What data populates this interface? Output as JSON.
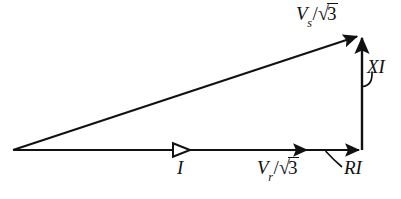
{
  "figure": {
    "background_color": "#ffffff",
    "stroke_color": "#111111",
    "width": 401,
    "height": 199
  },
  "labels": {
    "sending_voltage": {
      "name": "Vs/sqrt3",
      "variable": "V",
      "subscript": "s",
      "slash": "/",
      "radical": "√",
      "radicand": "3"
    },
    "receiving_voltage": {
      "name": "Vr/sqrt3",
      "variable": "V",
      "subscript": "r",
      "slash": "/",
      "radical": "√",
      "radicand": "3"
    },
    "reactive_drop": {
      "name": "XI",
      "text": "XI"
    },
    "resistive_drop": {
      "name": "RI",
      "text": "RI"
    },
    "current": {
      "name": "I",
      "text": "I"
    }
  },
  "geometry": {
    "origin_vertex": {
      "x": 13,
      "y": 150
    },
    "corner_vertex": {
      "x": 362,
      "y": 150
    },
    "apex_vertex": {
      "x": 362,
      "y": 35
    },
    "hypotenuse": {
      "name": "sending-voltage-phasor",
      "from": {
        "x": 13,
        "y": 150
      },
      "to": {
        "x": 362,
        "y": 35
      },
      "arrowhead": "solid"
    },
    "base": {
      "name": "receiving-voltage-phasor",
      "from": {
        "x": 13,
        "y": 150
      },
      "to": {
        "x": 362,
        "y": 150
      },
      "arrowhead": "solid",
      "mid_arrowhead_x": 306,
      "current_arrowhead_x": 186,
      "current_arrowhead": "hollow"
    },
    "vertical": {
      "name": "reactance-drop-phasor",
      "from": {
        "x": 362,
        "y": 150
      },
      "to": {
        "x": 362,
        "y": 35
      },
      "arrowhead": "solid"
    },
    "leader_xi": {
      "from": {
        "x": 371,
        "y": 73
      },
      "to": {
        "x": 363,
        "y": 85
      }
    },
    "leader_ri": {
      "from": {
        "x": 327,
        "y": 152
      },
      "to": {
        "x": 341,
        "y": 166
      }
    }
  }
}
